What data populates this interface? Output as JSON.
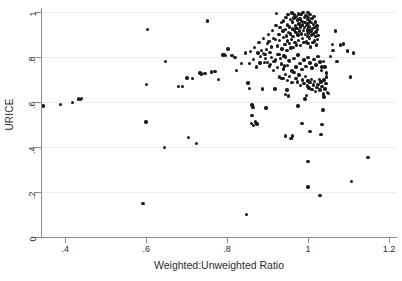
{
  "chart_data": {
    "type": "scatter",
    "title": "",
    "xlabel": "Weighted:Unweighted Ratio",
    "ylabel": "URICE",
    "xlim": [
      0.34,
      1.22
    ],
    "ylim": [
      0.0,
      1.02
    ],
    "xticks": [
      0.4,
      0.6,
      0.8,
      1.0,
      1.2
    ],
    "xtick_labels": [
      ".4",
      ".6",
      ".8",
      "1",
      "1.2"
    ],
    "yticks": [
      0.0,
      0.2,
      0.4,
      0.6,
      0.8,
      1.0
    ],
    "ytick_labels": [
      "0",
      ".2",
      ".4",
      ".6",
      ".8",
      "1"
    ],
    "grid": "horizontal",
    "legend": "none",
    "marker_color": "#1a1a1a",
    "grid_color": "#ededed",
    "axis_color": "#8c8c8c",
    "background": "#ffffff",
    "n_points": 268,
    "points": [
      [
        0.345,
        0.583
      ],
      [
        0.388,
        0.591
      ],
      [
        0.418,
        0.6
      ],
      [
        0.433,
        0.614
      ],
      [
        0.44,
        0.617
      ],
      [
        0.437,
        0.612
      ],
      [
        0.592,
        0.148
      ],
      [
        0.6,
        0.512
      ],
      [
        0.601,
        0.68
      ],
      [
        0.603,
        0.923
      ],
      [
        0.645,
        0.399
      ],
      [
        0.648,
        0.783
      ],
      [
        0.68,
        0.671
      ],
      [
        0.701,
        0.709
      ],
      [
        0.705,
        0.443
      ],
      [
        0.725,
        0.417
      ],
      [
        0.733,
        0.73
      ],
      [
        0.737,
        0.726
      ],
      [
        0.752,
        0.962
      ],
      [
        0.762,
        0.735
      ],
      [
        0.778,
        0.702
      ],
      [
        0.792,
        0.812
      ],
      [
        0.796,
        0.808
      ],
      [
        0.802,
        0.838
      ],
      [
        0.812,
        0.808
      ],
      [
        0.823,
        0.741
      ],
      [
        0.835,
        0.772
      ],
      [
        0.848,
        0.101
      ],
      [
        0.852,
        0.686
      ],
      [
        0.856,
        0.661
      ],
      [
        0.858,
        0.826
      ],
      [
        0.861,
        0.506
      ],
      [
        0.862,
        0.54
      ],
      [
        0.864,
        0.577
      ],
      [
        0.866,
        0.79
      ],
      [
        0.868,
        0.845
      ],
      [
        0.87,
        0.512
      ],
      [
        0.872,
        0.758
      ],
      [
        0.874,
        0.503
      ],
      [
        0.876,
        0.82
      ],
      [
        0.879,
        0.866
      ],
      [
        0.881,
        0.775
      ],
      [
        0.883,
        0.803
      ],
      [
        0.885,
        0.831
      ],
      [
        0.888,
        0.659
      ],
      [
        0.89,
        0.884
      ],
      [
        0.892,
        0.778
      ],
      [
        0.894,
        0.812
      ],
      [
        0.896,
        0.575
      ],
      [
        0.898,
        0.836
      ],
      [
        0.9,
        0.863
      ],
      [
        0.902,
        0.903
      ],
      [
        0.904,
        0.871
      ],
      [
        0.906,
        0.823
      ],
      [
        0.908,
        0.768
      ],
      [
        0.91,
        0.846
      ],
      [
        0.912,
        0.919
      ],
      [
        0.914,
        0.884
      ],
      [
        0.916,
        0.781
      ],
      [
        0.918,
        0.659
      ],
      [
        0.92,
        0.88
      ],
      [
        0.921,
        0.941
      ],
      [
        0.922,
        0.996
      ],
      [
        0.924,
        0.851
      ],
      [
        0.926,
        0.812
      ],
      [
        0.928,
        0.902
      ],
      [
        0.929,
        0.876
      ],
      [
        0.931,
        0.933
      ],
      [
        0.932,
        0.794
      ],
      [
        0.934,
        0.955
      ],
      [
        0.935,
        0.706
      ],
      [
        0.936,
        0.838
      ],
      [
        0.938,
        0.917
      ],
      [
        0.939,
        0.889
      ],
      [
        0.94,
        0.963
      ],
      [
        0.941,
        0.806
      ],
      [
        0.942,
        0.762
      ],
      [
        0.943,
        0.858
      ],
      [
        0.944,
        0.925
      ],
      [
        0.945,
        0.45
      ],
      [
        0.946,
        0.977
      ],
      [
        0.947,
        0.896
      ],
      [
        0.948,
        0.83
      ],
      [
        0.949,
        0.944
      ],
      [
        0.95,
        0.873
      ],
      [
        0.951,
        0.99
      ],
      [
        0.952,
        0.912
      ],
      [
        0.953,
        0.785
      ],
      [
        0.954,
        0.862
      ],
      [
        0.955,
        0.936
      ],
      [
        0.956,
        0.968
      ],
      [
        0.957,
        0.905
      ],
      [
        0.958,
        0.841
      ],
      [
        0.959,
        0.88
      ],
      [
        0.96,
        0.998
      ],
      [
        0.961,
        0.927
      ],
      [
        0.962,
        0.958
      ],
      [
        0.963,
        0.893
      ],
      [
        0.964,
        0.845
      ],
      [
        0.965,
        0.975
      ],
      [
        0.966,
        0.922
      ],
      [
        0.967,
        0.988
      ],
      [
        0.968,
        0.867
      ],
      [
        0.969,
        0.94
      ],
      [
        0.97,
        0.911
      ],
      [
        0.971,
        0.983
      ],
      [
        0.972,
        0.855
      ],
      [
        0.973,
        0.93
      ],
      [
        0.974,
        0.966
      ],
      [
        0.975,
        0.899
      ],
      [
        0.976,
        0.994
      ],
      [
        0.977,
        0.876
      ],
      [
        0.978,
        0.948
      ],
      [
        0.979,
        0.918
      ],
      [
        0.98,
        0.971
      ],
      [
        0.981,
        0.852
      ],
      [
        0.982,
        0.935
      ],
      [
        0.983,
        0.991
      ],
      [
        0.984,
        0.905
      ],
      [
        0.985,
        0.96
      ],
      [
        0.986,
        0.884
      ],
      [
        0.987,
        0.944
      ],
      [
        0.988,
        0.999
      ],
      [
        0.989,
        0.921
      ],
      [
        0.99,
        0.866
      ],
      [
        0.991,
        0.977
      ],
      [
        0.992,
        0.932
      ],
      [
        0.993,
        0.955
      ],
      [
        0.994,
        0.902
      ],
      [
        0.995,
        0.986
      ],
      [
        0.996,
        0.87
      ],
      [
        0.997,
        0.941
      ],
      [
        0.998,
        0.915
      ],
      [
        0.999,
        0.968
      ],
      [
        1.0,
        0.893
      ],
      [
        1.0,
        0.999
      ],
      [
        1.0,
        0.95
      ],
      [
        1.0,
        0.862
      ],
      [
        1.0,
        0.922
      ],
      [
        1.0,
        0.978
      ],
      [
        1.001,
        0.908
      ],
      [
        1.002,
        0.936
      ],
      [
        1.003,
        0.963
      ],
      [
        1.004,
        0.884
      ],
      [
        1.005,
        0.992
      ],
      [
        1.006,
        0.847
      ],
      [
        1.007,
        0.918
      ],
      [
        1.008,
        0.955
      ],
      [
        1.009,
        0.899
      ],
      [
        1.01,
        0.973
      ],
      [
        1.011,
        0.929
      ],
      [
        1.012,
        0.866
      ],
      [
        1.013,
        0.946
      ],
      [
        1.014,
        0.905
      ],
      [
        1.015,
        0.982
      ],
      [
        1.016,
        0.873
      ],
      [
        1.017,
        0.934
      ],
      [
        1.018,
        0.958
      ],
      [
        1.019,
        0.892
      ],
      [
        1.02,
        0.914
      ],
      [
        1.021,
        0.856
      ],
      [
        1.022,
        0.94
      ],
      [
        1.023,
        0.88
      ],
      [
        1.024,
        0.925
      ],
      [
        1.025,
        0.898
      ],
      [
        0.93,
        0.712
      ],
      [
        0.938,
        0.705
      ],
      [
        0.944,
        0.724
      ],
      [
        0.95,
        0.698
      ],
      [
        0.955,
        0.716
      ],
      [
        0.96,
        0.688
      ],
      [
        0.965,
        0.732
      ],
      [
        0.97,
        0.707
      ],
      [
        0.974,
        0.69
      ],
      [
        0.978,
        0.721
      ],
      [
        0.982,
        0.676
      ],
      [
        0.986,
        0.7
      ],
      [
        0.99,
        0.683
      ],
      [
        0.994,
        0.715
      ],
      [
        0.998,
        0.672
      ],
      [
        1.0,
        0.695
      ],
      [
        1.002,
        0.664
      ],
      [
        1.005,
        0.688
      ],
      [
        1.008,
        0.702
      ],
      [
        1.01,
        0.658
      ],
      [
        1.013,
        0.677
      ],
      [
        1.016,
        0.692
      ],
      [
        1.019,
        0.648
      ],
      [
        1.022,
        0.666
      ],
      [
        1.025,
        0.68
      ],
      [
        1.028,
        0.702
      ],
      [
        1.03,
        0.655
      ],
      [
        1.032,
        0.69
      ],
      [
        1.035,
        0.671
      ],
      [
        1.038,
        0.637
      ],
      [
        1.04,
        0.7
      ],
      [
        1.042,
        0.659
      ],
      [
        1.044,
        0.683
      ],
      [
        1.046,
        0.712
      ],
      [
        1.048,
        0.644
      ],
      [
        0.89,
        0.818
      ],
      [
        0.895,
        0.795
      ],
      [
        0.9,
        0.776
      ],
      [
        0.905,
        0.762
      ],
      [
        0.91,
        0.8
      ],
      [
        0.915,
        0.742
      ],
      [
        0.92,
        0.788
      ],
      [
        0.925,
        0.755
      ],
      [
        0.93,
        0.812
      ],
      [
        0.935,
        0.77
      ],
      [
        0.94,
        0.748
      ],
      [
        0.945,
        0.802
      ],
      [
        0.95,
        0.765
      ],
      [
        0.955,
        0.782
      ],
      [
        0.96,
        0.74
      ],
      [
        0.965,
        0.795
      ],
      [
        0.97,
        0.758
      ],
      [
        0.975,
        0.81
      ],
      [
        0.98,
        0.772
      ],
      [
        0.985,
        0.745
      ],
      [
        0.99,
        0.788
      ],
      [
        0.995,
        0.76
      ],
      [
        1.0,
        0.8
      ],
      [
        1.005,
        0.775
      ],
      [
        1.01,
        0.752
      ],
      [
        1.015,
        0.79
      ],
      [
        1.02,
        0.766
      ],
      [
        1.025,
        0.805
      ],
      [
        1.03,
        0.78
      ],
      [
        1.035,
        0.757
      ],
      [
        0.975,
        0.583
      ],
      [
        0.985,
        0.505
      ],
      [
        1.0,
        0.337
      ],
      [
        1.0,
        0.222
      ],
      [
        1.005,
        0.47
      ],
      [
        1.03,
        0.186
      ],
      [
        1.032,
        0.457
      ],
      [
        1.035,
        0.5
      ],
      [
        1.037,
        0.566
      ],
      [
        1.04,
        0.623
      ],
      [
        0.958,
        0.44
      ],
      [
        0.962,
        0.45
      ],
      [
        1.05,
        0.64
      ],
      [
        1.055,
        0.805
      ],
      [
        1.06,
        0.857
      ],
      [
        1.062,
        0.83
      ],
      [
        1.068,
        0.917
      ],
      [
        1.072,
        0.782
      ],
      [
        1.08,
        0.855
      ],
      [
        1.088,
        0.86
      ],
      [
        1.098,
        0.828
      ],
      [
        1.105,
        0.712
      ],
      [
        1.108,
        0.248
      ],
      [
        1.112,
        0.82
      ],
      [
        1.148,
        0.355
      ],
      [
        0.862,
        0.588
      ],
      [
        0.866,
        0.498
      ],
      [
        0.845,
        0.82
      ],
      [
        0.855,
        0.772
      ],
      [
        0.82,
        0.8
      ],
      [
        0.79,
        0.81
      ],
      [
        0.77,
        0.736
      ],
      [
        0.745,
        0.728
      ],
      [
        0.715,
        0.706
      ],
      [
        0.69,
        0.67
      ],
      [
        1.045,
        0.73
      ],
      [
        1.042,
        0.758
      ],
      [
        1.038,
        0.783
      ],
      [
        1.034,
        0.742
      ],
      [
        0.948,
        0.655
      ],
      [
        0.952,
        0.628
      ],
      [
        0.944,
        0.636
      ],
      [
        0.993,
        0.614
      ],
      [
        0.997,
        0.63
      ]
    ]
  }
}
